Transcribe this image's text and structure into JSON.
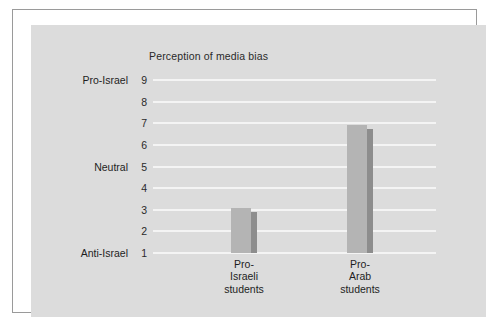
{
  "chart_data": {
    "type": "bar",
    "title": "Perception of media bias",
    "xlabel": "",
    "ylabel": "",
    "categories": [
      "Pro-Israeli students",
      "Pro-Arab students"
    ],
    "category_lines": [
      [
        "Pro-",
        "Israeli",
        "students"
      ],
      [
        "Pro-",
        "Arab",
        "students"
      ]
    ],
    "values": [
      2.9,
      6.75
    ],
    "ylim": [
      1,
      9
    ],
    "yticks": [
      9,
      8,
      7,
      6,
      5,
      4,
      3,
      2,
      1
    ],
    "ytick_labels": [
      "9",
      "8",
      "7",
      "6",
      "5",
      "4",
      "3",
      "2",
      "1"
    ],
    "y_category_labels": [
      {
        "value": 9,
        "label": "Pro-Israel"
      },
      {
        "value": 5,
        "label": "Neutral"
      },
      {
        "value": 1,
        "label": "Anti-Israel"
      }
    ],
    "grid": true,
    "legend": false,
    "colors": {
      "plot_background": "#dcdcdc",
      "gridline": "#f4f4f4",
      "bar_face": "#b4b4b4",
      "bar_shadow": "#8d8d8d",
      "text": "#1e1e1e",
      "frame_border": "#9a9a9a",
      "page_background": "#ffffff"
    }
  }
}
